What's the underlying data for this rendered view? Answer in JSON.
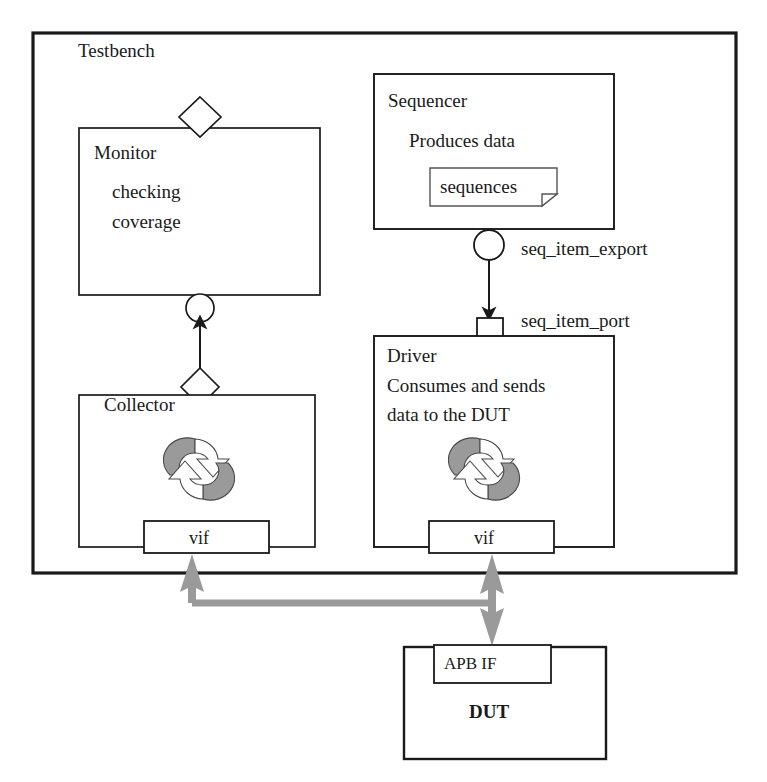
{
  "diagram": {
    "type": "block-diagram",
    "colors": {
      "stroke": "#1a1a1a",
      "fill": "#ffffff",
      "gray_arrow": "#9a9a9a",
      "recycle_gray": "#9a9a9a"
    }
  },
  "testbench": {
    "label": "Testbench"
  },
  "monitor": {
    "title": "Monitor",
    "line1": "checking",
    "line2": "coverage"
  },
  "sequencer": {
    "title": "Sequencer",
    "subtitle": "Produces data",
    "note": "sequences"
  },
  "ports": {
    "seq_item_export": "seq_item_export",
    "seq_item_port": "seq_item_port"
  },
  "driver": {
    "title": "Driver",
    "line1": "Consumes and sends",
    "line2": "data to the DUT",
    "vif": "vif"
  },
  "collector": {
    "title": "Collector",
    "vif": "vif"
  },
  "dut": {
    "interface": "APB IF",
    "title": "DUT"
  }
}
